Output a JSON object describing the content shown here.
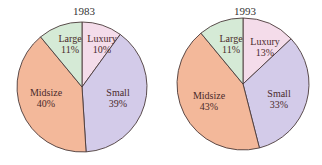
{
  "chart_data": [
    {
      "type": "pie",
      "title": "1983",
      "categories": [
        "Luxury",
        "Small",
        "Midsize",
        "Large"
      ],
      "values": [
        10,
        39,
        40,
        11
      ],
      "labels": [
        "Luxury\n10%",
        "Small\n39%",
        "Midsize\n40%",
        "Large\n11%"
      ],
      "colors": [
        "#f4dcea",
        "#d3cbe9",
        "#f3b89a",
        "#d5ead6"
      ]
    },
    {
      "type": "pie",
      "title": "1993",
      "categories": [
        "Luxury",
        "Small",
        "Midsize",
        "Large"
      ],
      "values": [
        13,
        33,
        43,
        11
      ],
      "labels": [
        "Luxury\n13%",
        "Small\n33%",
        "Midsize\n43%",
        "Large\n11%"
      ],
      "colors": [
        "#f4dcea",
        "#d3cbe9",
        "#f3b89a",
        "#d5ead6"
      ]
    }
  ],
  "charts": [
    {
      "title": "1983",
      "slices": [
        {
          "name": "Luxury",
          "pct": "10%"
        },
        {
          "name": "Small",
          "pct": "39%"
        },
        {
          "name": "Midsize",
          "pct": "40%"
        },
        {
          "name": "Large",
          "pct": "11%"
        }
      ]
    },
    {
      "title": "1993",
      "slices": [
        {
          "name": "Luxury",
          "pct": "13%"
        },
        {
          "name": "Small",
          "pct": "33%"
        },
        {
          "name": "Midsize",
          "pct": "43%"
        },
        {
          "name": "Large",
          "pct": "11%"
        }
      ]
    }
  ]
}
